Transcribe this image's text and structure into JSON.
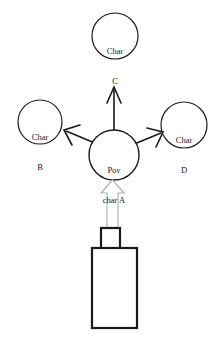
{
  "diagram": {
    "type": "pov-character-relationship-diagram",
    "background_color": "#ffffff",
    "stroke_color": "#1a1a1a",
    "hollow_arrow_color": "#b3b3b3",
    "nodes": [
      {
        "id": "char-c",
        "line1": "Char",
        "line2": "C",
        "cx": 115,
        "cy": 36,
        "r": 23
      },
      {
        "id": "char-b",
        "line1": "Char",
        "line2": "B",
        "cx": 40,
        "cy": 122,
        "r": 22
      },
      {
        "id": "char-d",
        "line1": "Char",
        "line2": "D",
        "cx": 184,
        "cy": 125,
        "r": 23
      },
      {
        "id": "pov-char-a",
        "line1": "Pov",
        "line2": "char A",
        "cx": 114,
        "cy": 155,
        "r": 25
      }
    ],
    "gaze_arrows": [
      {
        "id": "arrow-to-char-c",
        "label": "up"
      },
      {
        "id": "arrow-to-char-b",
        "label": "up-left"
      },
      {
        "id": "arrow-to-char-d",
        "label": "up-right"
      }
    ],
    "camera_arrow": {
      "id": "camera-view-arrow",
      "label": "hollow-up-arrow"
    },
    "camera": {
      "id": "camera",
      "lens": {
        "x": 101,
        "y": 228,
        "w": 19,
        "h": 21
      },
      "body": {
        "x": 92,
        "y": 248,
        "w": 45,
        "h": 80
      }
    }
  }
}
